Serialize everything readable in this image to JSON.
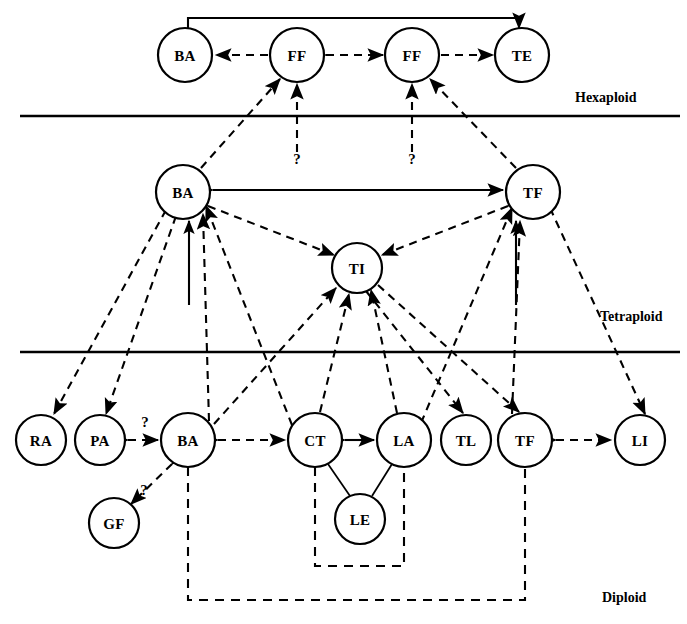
{
  "figure": {
    "background_color": "#ffffff",
    "line_color": "#000000",
    "width": 687,
    "height": 624
  },
  "ploidy_levels": [
    {
      "id": "hexaploid",
      "label": "Hexaploid",
      "label_x": 575,
      "label_y": 97,
      "divider_y": 116,
      "divider_x1": 20,
      "divider_x2": 680
    },
    {
      "id": "tetraploid",
      "label": "Tetraploid",
      "label_x": 600,
      "label_y": 316,
      "divider_y": 352,
      "divider_x1": 20,
      "divider_x2": 680
    },
    {
      "id": "diploid",
      "label": "Diploid",
      "label_x": 602,
      "label_y": 597
    }
  ],
  "nodes": [
    {
      "id": "h_ba",
      "label": "BA",
      "x": 185,
      "y": 55,
      "r": 27,
      "level": "hexaploid"
    },
    {
      "id": "h_ff1",
      "label": "FF",
      "x": 297,
      "y": 55,
      "r": 27,
      "level": "hexaploid"
    },
    {
      "id": "h_ff2",
      "label": "FF",
      "x": 412,
      "y": 55,
      "r": 27,
      "level": "hexaploid"
    },
    {
      "id": "h_te",
      "label": "TE",
      "x": 522,
      "y": 55,
      "r": 27,
      "level": "hexaploid"
    },
    {
      "id": "t_ba",
      "label": "BA",
      "x": 183,
      "y": 192,
      "r": 27,
      "level": "tetraploid"
    },
    {
      "id": "t_tf",
      "label": "TF",
      "x": 533,
      "y": 192,
      "r": 27,
      "level": "tetraploid"
    },
    {
      "id": "t_ti",
      "label": "TI",
      "x": 357,
      "y": 268,
      "r": 25,
      "level": "tetraploid"
    },
    {
      "id": "d_ra",
      "label": "RA",
      "x": 41,
      "y": 440,
      "r": 25,
      "level": "diploid"
    },
    {
      "id": "d_pa",
      "label": "PA",
      "x": 100,
      "y": 440,
      "r": 25,
      "level": "diploid"
    },
    {
      "id": "d_ba",
      "label": "BA",
      "x": 188,
      "y": 440,
      "r": 27,
      "level": "diploid"
    },
    {
      "id": "d_ct",
      "label": "CT",
      "x": 315,
      "y": 440,
      "r": 27,
      "level": "diploid"
    },
    {
      "id": "d_la",
      "label": "LA",
      "x": 404,
      "y": 440,
      "r": 27,
      "level": "diploid"
    },
    {
      "id": "d_tl",
      "label": "TL",
      "x": 466,
      "y": 440,
      "r": 25,
      "level": "diploid"
    },
    {
      "id": "d_tf",
      "label": "TF",
      "x": 525,
      "y": 440,
      "r": 27,
      "level": "diploid"
    },
    {
      "id": "d_li",
      "label": "LI",
      "x": 640,
      "y": 440,
      "r": 25,
      "level": "diploid"
    },
    {
      "id": "d_gf",
      "label": "GF",
      "x": 114,
      "y": 523,
      "r": 25,
      "level": "diploid"
    },
    {
      "id": "d_le",
      "label": "LE",
      "x": 360,
      "y": 519,
      "r": 25,
      "level": "diploid"
    }
  ],
  "edges": [
    {
      "id": "e1",
      "from": "h_ba",
      "to": "h_te",
      "style": "solid",
      "arrows": "both",
      "route": "arc-top",
      "note": "BA hexaploid to TE hexaploid over the top"
    },
    {
      "id": "e2",
      "from": "h_ff1",
      "to": "h_ba",
      "style": "dashed",
      "arrows": "forward"
    },
    {
      "id": "e3",
      "from": "h_ff1",
      "to": "h_ff2",
      "style": "dashed",
      "arrows": "both"
    },
    {
      "id": "e4",
      "from": "h_ff2",
      "to": "h_te",
      "style": "dashed",
      "arrows": "forward"
    },
    {
      "id": "e5",
      "from": "t_ba",
      "to": "h_ff1",
      "style": "dashed",
      "arrows": "forward"
    },
    {
      "id": "e6",
      "from": "t_tf",
      "to": "h_ff2",
      "style": "dashed",
      "arrows": "forward"
    },
    {
      "id": "e7",
      "from": "unknown1",
      "to": "h_ff1",
      "style": "dashed",
      "arrows": "forward",
      "label": "?"
    },
    {
      "id": "e8",
      "from": "unknown2",
      "to": "h_ff2",
      "style": "dashed",
      "arrows": "forward",
      "label": "?"
    },
    {
      "id": "e9",
      "from": "t_ba",
      "to": "t_tf",
      "style": "solid",
      "arrows": "both"
    },
    {
      "id": "e10",
      "from": "t_ba",
      "to": "t_ti",
      "style": "dashed",
      "arrows": "both"
    },
    {
      "id": "e11",
      "from": "t_tf",
      "to": "t_ti",
      "style": "dashed",
      "arrows": "both"
    },
    {
      "id": "e12",
      "from": "t_ba",
      "to": "d_ra",
      "style": "dashed",
      "arrows": "both"
    },
    {
      "id": "e13",
      "from": "t_ba",
      "to": "d_pa",
      "style": "dashed",
      "arrows": "both"
    },
    {
      "id": "e14",
      "from": "t_ba",
      "to": "origin_ba",
      "style": "solid",
      "arrows": "forward",
      "note": "thick solid vertical arrow into tetraploid BA"
    },
    {
      "id": "e15",
      "from": "d_ba",
      "to": "t_ba",
      "style": "dashed",
      "arrows": "forward"
    },
    {
      "id": "e16",
      "from": "d_ct",
      "to": "t_ba",
      "style": "dashed",
      "arrows": "forward"
    },
    {
      "id": "e17",
      "from": "t_tf",
      "to": "origin_tf",
      "style": "solid",
      "arrows": "forward",
      "note": "thick solid vertical arrow into tetraploid TF"
    },
    {
      "id": "e18",
      "from": "d_tf",
      "to": "t_tf",
      "style": "dashed",
      "arrows": "forward"
    },
    {
      "id": "e19",
      "from": "d_la",
      "to": "t_tf",
      "style": "dashed",
      "arrows": "forward"
    },
    {
      "id": "e20",
      "from": "t_tf",
      "to": "d_li",
      "style": "dashed",
      "arrows": "both"
    },
    {
      "id": "e21",
      "from": "d_ba",
      "to": "t_ti",
      "style": "dashed",
      "arrows": "forward"
    },
    {
      "id": "e22",
      "from": "d_ct",
      "to": "t_ti",
      "style": "dashed",
      "arrows": "forward"
    },
    {
      "id": "e23",
      "from": "d_la",
      "to": "t_ti",
      "style": "dashed",
      "arrows": "forward"
    },
    {
      "id": "e24",
      "from": "t_ti",
      "to": "d_tl",
      "style": "dashed",
      "arrows": "forward"
    },
    {
      "id": "e25",
      "from": "t_ti",
      "to": "d_tf",
      "style": "dashed",
      "arrows": "forward"
    },
    {
      "id": "e26",
      "from": "d_pa",
      "to": "d_ba",
      "style": "dashed",
      "arrows": "both",
      "label": "?"
    },
    {
      "id": "e27",
      "from": "d_ba",
      "to": "d_gf",
      "style": "dashed",
      "arrows": "both",
      "label": "?"
    },
    {
      "id": "e28",
      "from": "d_ba",
      "to": "d_ct",
      "style": "dashed",
      "arrows": "both"
    },
    {
      "id": "e29",
      "from": "d_ct",
      "to": "d_la",
      "style": "solid",
      "arrows": "both"
    },
    {
      "id": "e30",
      "from": "d_tf",
      "to": "d_li",
      "style": "dashed",
      "arrows": "both"
    },
    {
      "id": "e31",
      "from": "d_ct",
      "to": "d_le",
      "style": "plain",
      "arrows": "none"
    },
    {
      "id": "e32",
      "from": "d_la",
      "to": "d_le",
      "style": "plain",
      "arrows": "none"
    }
  ],
  "brackets": [
    {
      "id": "b1",
      "style": "dashed",
      "note": "inner bracket joining CT and LA below LE",
      "points": "315,467 315,566 404,566 404,467"
    },
    {
      "id": "b2",
      "style": "dashed",
      "note": "outer bracket joining diploid BA and diploid TF",
      "points": "188,467 188,600 525,600 525,467"
    }
  ],
  "question_marks": [
    {
      "id": "q_ff1",
      "text": "?",
      "x": 297,
      "y": 159
    },
    {
      "id": "q_ff2",
      "text": "?",
      "x": 412,
      "y": 159
    },
    {
      "id": "q_paba",
      "text": "?",
      "x": 145,
      "y": 422
    },
    {
      "id": "q_bagf",
      "text": "?",
      "x": 144,
      "y": 490
    }
  ]
}
